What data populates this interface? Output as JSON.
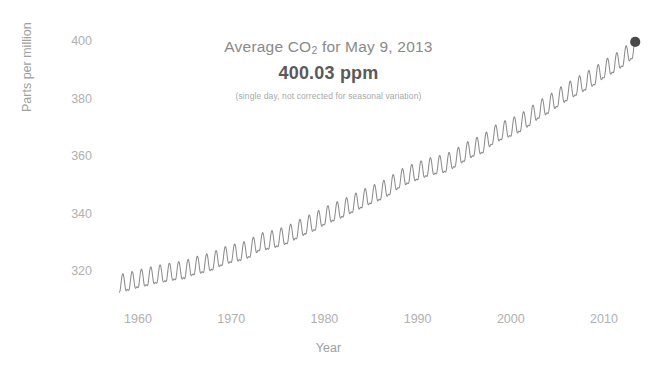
{
  "annotation": {
    "title_prefix": "Average CO",
    "title_sub": "2",
    "title_suffix": " for May 9, 2013",
    "value": "400.03 ppm",
    "note": "(single day, not corrected for seasonal variation)"
  },
  "chart_data": {
    "type": "line",
    "title": "Average CO2 for May 9, 2013",
    "subtitle": "400.03 ppm",
    "annotation": "(single day, not corrected for seasonal variation)",
    "xlabel": "Year",
    "ylabel": "Parts per million",
    "xlim": [
      1958,
      2013.4
    ],
    "ylim": [
      313,
      402
    ],
    "xticks": [
      1960,
      1970,
      1980,
      1990,
      2000,
      2010
    ],
    "yticks": [
      320,
      340,
      360,
      380,
      400
    ],
    "grid": false,
    "legend": null,
    "line_color": "#8c8c8c",
    "marker_color": "#4a4a4a",
    "seasonal_amplitude_ppm": 3.1,
    "seasonal_peak_month": 0.37,
    "trend_note": "Annual-mean CO2 concentration at Mauna Loa; monthly values oscillate seasonally about the trend.",
    "x": [
      1958,
      1959,
      1960,
      1961,
      1962,
      1963,
      1964,
      1965,
      1966,
      1967,
      1968,
      1969,
      1970,
      1971,
      1972,
      1973,
      1974,
      1975,
      1976,
      1977,
      1978,
      1979,
      1980,
      1981,
      1982,
      1983,
      1984,
      1985,
      1986,
      1987,
      1988,
      1989,
      1990,
      1991,
      1992,
      1993,
      1994,
      1995,
      1996,
      1997,
      1998,
      1999,
      2000,
      2001,
      2002,
      2003,
      2004,
      2005,
      2006,
      2007,
      2008,
      2009,
      2010,
      2011,
      2012,
      2013
    ],
    "values": [
      315.3,
      315.98,
      316.91,
      317.64,
      318.45,
      318.99,
      319.62,
      320.04,
      321.38,
      322.16,
      323.04,
      324.62,
      325.68,
      326.32,
      327.45,
      329.68,
      330.25,
      331.15,
      332.15,
      333.9,
      335.5,
      336.85,
      338.75,
      340.11,
      341.45,
      343.05,
      344.65,
      346.12,
      347.42,
      349.19,
      351.57,
      353.12,
      354.39,
      355.61,
      356.45,
      357.1,
      358.83,
      360.82,
      362.61,
      363.73,
      366.7,
      368.38,
      369.55,
      371.14,
      373.28,
      375.8,
      377.52,
      379.8,
      381.9,
      383.79,
      385.6,
      387.43,
      389.9,
      391.65,
      393.85,
      396.5
    ],
    "final_point": {
      "x": 2013.35,
      "y": 400.03,
      "label": "400.03 ppm",
      "marker": "filled-circle"
    }
  }
}
